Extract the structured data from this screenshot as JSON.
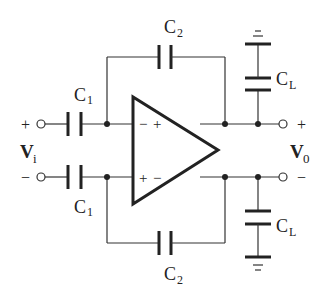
{
  "diagram": {
    "type": "fully-differential op-amp switched/capacitive amplifier schematic",
    "colors": {
      "line": "#222222",
      "background": "#ffffff"
    },
    "input": {
      "label": "V",
      "subscript": "i",
      "plus_sign": "+",
      "minus_sign": "−"
    },
    "output": {
      "label": "V",
      "subscript": "0",
      "plus_sign": "+",
      "minus_sign": "−"
    },
    "opamp": {
      "top_input_sign": "−",
      "top_output_sign": "+",
      "bottom_input_sign": "+",
      "bottom_output_sign": "−"
    },
    "capacitors": {
      "c1_top": {
        "label": "C",
        "subscript": "1"
      },
      "c1_bottom": {
        "label": "C",
        "subscript": "1"
      },
      "c2_top": {
        "label": "C",
        "subscript": "2"
      },
      "c2_bottom": {
        "label": "C",
        "subscript": "2"
      },
      "cl_top": {
        "label": "C",
        "subscript": "L"
      },
      "cl_bottom": {
        "label": "C",
        "subscript": "L"
      }
    }
  }
}
